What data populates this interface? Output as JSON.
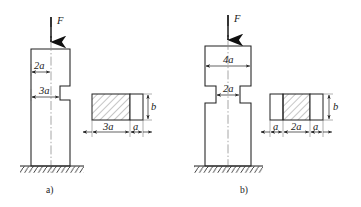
{
  "document": {
    "title": "Two stepped columns under axial load F with cross-sections",
    "background_color": "#ffffff",
    "line_color": "#202020",
    "centerline_color": "#8a8a8a"
  },
  "figures": [
    {
      "id": "a",
      "caption": "a)",
      "force_label": "F",
      "column": {
        "description": "Stepped column with a single notch cut into the right-hand face",
        "dimensions": [
          {
            "name": "upper-width",
            "label": "2a",
            "value": "2a"
          },
          {
            "name": "lower-width",
            "label": "3a",
            "value": "3a"
          }
        ]
      },
      "cross_section": {
        "height_label": "b",
        "widths": [
          {
            "label": "3a",
            "hatched": true
          },
          {
            "label": "a",
            "hatched": false
          }
        ]
      }
    },
    {
      "id": "b",
      "caption": "b)",
      "force_label": "F",
      "column": {
        "description": "Stepped column with symmetric notches cut into both faces",
        "dimensions": [
          {
            "name": "upper-width",
            "label": "4a",
            "value": "4a"
          },
          {
            "name": "waist-width",
            "label": "2a",
            "value": "2a"
          }
        ]
      },
      "cross_section": {
        "height_label": "b",
        "widths": [
          {
            "label": "a",
            "hatched": false
          },
          {
            "label": "2a",
            "hatched": true
          },
          {
            "label": "a",
            "hatched": false
          }
        ]
      }
    }
  ]
}
